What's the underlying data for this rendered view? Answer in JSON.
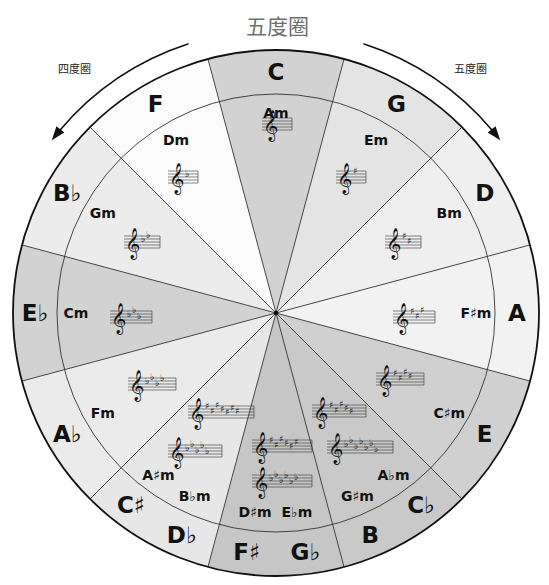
{
  "title": "五度圈",
  "arrows": {
    "left_label": "四度圈",
    "right_label": "五度圈"
  },
  "segments": [
    {
      "major": "C",
      "major_alt": "",
      "minor": "Am",
      "minor_alt": "",
      "shade": "#d2d2d2",
      "staves": [
        {
          "type": "none",
          "count": 0
        }
      ]
    },
    {
      "major": "G",
      "major_alt": "",
      "minor": "Em",
      "minor_alt": "",
      "shade": "#e4e4e4",
      "staves": [
        {
          "type": "sharp",
          "count": 1
        }
      ]
    },
    {
      "major": "D",
      "major_alt": "",
      "minor": "Bm",
      "minor_alt": "",
      "shade": "#efefef",
      "staves": [
        {
          "type": "sharp",
          "count": 2
        }
      ]
    },
    {
      "major": "A",
      "major_alt": "",
      "minor": "F♯m",
      "minor_alt": "",
      "shade": "#f2f2f2",
      "staves": [
        {
          "type": "sharp",
          "count": 3
        }
      ]
    },
    {
      "major": "E",
      "major_alt": "",
      "minor": "C♯m",
      "minor_alt": "",
      "shade": "#d0d0d0",
      "staves": [
        {
          "type": "sharp",
          "count": 4
        }
      ]
    },
    {
      "major": "B",
      "major_alt": "C♭",
      "minor": "G♯m",
      "minor_alt": "A♭m",
      "shade": "#c9c9c9",
      "staves": [
        {
          "type": "sharp",
          "count": 5
        },
        {
          "type": "flat",
          "count": 7
        }
      ]
    },
    {
      "major": "F♯",
      "major_alt": "G♭",
      "minor": "D♯m",
      "minor_alt": "E♭m",
      "shade": "#c6c6c6",
      "staves": [
        {
          "type": "sharp",
          "count": 6
        },
        {
          "type": "flat",
          "count": 6
        }
      ]
    },
    {
      "major": "C♯",
      "major_alt": "D♭",
      "minor": "A♯m",
      "minor_alt": "B♭m",
      "shade": "#e7e7e7",
      "staves": [
        {
          "type": "sharp",
          "count": 7
        },
        {
          "type": "flat",
          "count": 5
        }
      ]
    },
    {
      "major": "A♭",
      "major_alt": "",
      "minor": "Fm",
      "minor_alt": "",
      "shade": "#ebebeb",
      "staves": [
        {
          "type": "flat",
          "count": 4
        }
      ]
    },
    {
      "major": "E♭",
      "major_alt": "",
      "minor": "Cm",
      "minor_alt": "",
      "shade": "#d2d2d2",
      "staves": [
        {
          "type": "flat",
          "count": 3
        }
      ]
    },
    {
      "major": "B♭",
      "major_alt": "",
      "minor": "Gm",
      "minor_alt": "",
      "shade": "#ececec",
      "staves": [
        {
          "type": "flat",
          "count": 2
        }
      ]
    },
    {
      "major": "F",
      "major_alt": "",
      "minor": "Dm",
      "minor_alt": "",
      "shade": "#fbfbfb",
      "staves": [
        {
          "type": "flat",
          "count": 1
        }
      ]
    }
  ],
  "icons": {
    "clef": "𝄞",
    "sharp": "♯",
    "flat": "♭"
  }
}
